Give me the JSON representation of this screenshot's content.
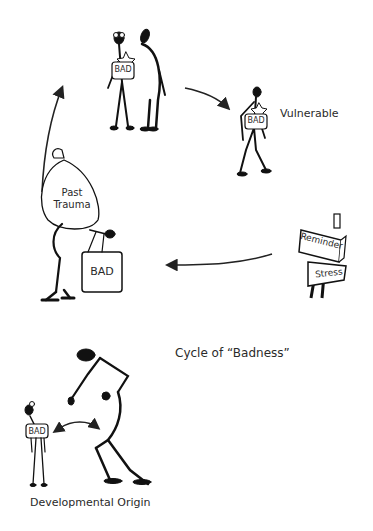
{
  "diagram": {
    "title": "Cycle of “Badness”",
    "cycle_nodes": [
      {
        "id": "paired",
        "description": "Two figures standing together, one carrying a BAD box",
        "box_label": "BAD"
      },
      {
        "id": "vulnerable",
        "label": "Vulnerable",
        "box_label": "BAD"
      },
      {
        "id": "trigger",
        "signs": [
          "Reminder",
          "Stress"
        ]
      },
      {
        "id": "burdened",
        "sack_label_line1": "Past",
        "sack_label_line2": "Trauma",
        "case_label": "BAD"
      }
    ],
    "flow": [
      "paired",
      "vulnerable",
      "trigger",
      "burdened",
      "paired"
    ],
    "origin": {
      "label": "Developmental Origin",
      "child_box_label": "BAD",
      "relation": "bidirectional arrow between child and adult"
    }
  }
}
